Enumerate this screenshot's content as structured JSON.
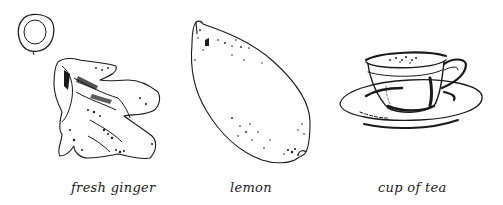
{
  "illustrations": [
    {
      "id": "ginger",
      "caption": "fresh ginger",
      "icon": "ginger-root-icon"
    },
    {
      "id": "lemon",
      "caption": "lemon",
      "icon": "lemon-icon"
    },
    {
      "id": "tea",
      "caption": "cup of tea",
      "icon": "teacup-icon"
    }
  ],
  "colors": {
    "ink": "#1a1a1a",
    "background": "#ffffff"
  }
}
